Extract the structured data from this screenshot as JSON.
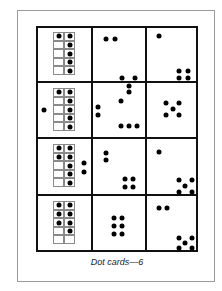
{
  "caption": "Dot cards—6",
  "grid": {
    "left": 36,
    "top": 26,
    "col_x": [
      36,
      92,
      146,
      197
    ],
    "row_y": [
      26,
      82,
      138,
      195,
      251
    ]
  },
  "rows": [
    {
      "tenframe": {
        "x": 53,
        "y": 32,
        "filled": [
          [
            0,
            0
          ],
          [
            0,
            1
          ],
          [
            1,
            1
          ],
          [
            2,
            1
          ],
          [
            3,
            1
          ],
          [
            4,
            1
          ]
        ]
      },
      "extra_dots": [],
      "col2_dots": [
        [
          14,
          13
        ],
        [
          23,
          13
        ],
        [
          30,
          52
        ],
        [
          43,
          52
        ],
        [
          37,
          60
        ]
      ],
      "col3_dots": [
        [
          13,
          10
        ],
        [
          33,
          45
        ],
        [
          42,
          45
        ],
        [
          33,
          52
        ],
        [
          42,
          52
        ]
      ]
    },
    {
      "tenframe": {
        "x": 53,
        "y": 88,
        "filled": [
          [
            0,
            0
          ],
          [
            0,
            1
          ],
          [
            1,
            1
          ],
          [
            2,
            1
          ],
          [
            3,
            1
          ],
          [
            4,
            1
          ]
        ]
      },
      "extra_dots": [
        [
          44,
          110
        ]
      ],
      "col2_dots": [
        [
          37,
          10
        ],
        [
          29,
          19
        ],
        [
          6,
          25
        ],
        [
          6,
          33
        ],
        [
          29,
          44
        ],
        [
          37,
          44
        ],
        [
          45,
          44
        ]
      ],
      "col3_dots": [
        [
          20,
          21
        ],
        [
          33,
          21
        ],
        [
          27,
          27
        ],
        [
          20,
          33
        ],
        [
          33,
          33
        ]
      ]
    },
    {
      "tenframe": {
        "x": 53,
        "y": 144,
        "filled": [
          [
            0,
            0
          ],
          [
            0,
            1
          ],
          [
            1,
            0
          ],
          [
            1,
            1
          ],
          [
            2,
            1
          ],
          [
            3,
            1
          ],
          [
            4,
            1
          ]
        ]
      },
      "extra_dots": [
        [
          84,
          163
        ],
        [
          84,
          172
        ]
      ],
      "col2_dots": [
        [
          14,
          15
        ],
        [
          14,
          22
        ],
        [
          33,
          41
        ],
        [
          41,
          41
        ],
        [
          33,
          49
        ],
        [
          41,
          49
        ]
      ],
      "col3_dots": [
        [
          13,
          14
        ],
        [
          33,
          42
        ],
        [
          46,
          42
        ],
        [
          39,
          48
        ],
        [
          33,
          54
        ],
        [
          46,
          54
        ]
      ]
    },
    {
      "tenframe": {
        "x": 53,
        "y": 201,
        "filled": [
          [
            0,
            0
          ],
          [
            0,
            1
          ],
          [
            1,
            0
          ],
          [
            1,
            1
          ],
          [
            2,
            0
          ],
          [
            2,
            1
          ],
          [
            3,
            1
          ]
        ]
      },
      "extra_dots": [],
      "col2_dots": [
        [
          22,
          23
        ],
        [
          30,
          23
        ],
        [
          22,
          31
        ],
        [
          30,
          31
        ],
        [
          22,
          39
        ],
        [
          30,
          39
        ]
      ],
      "col3_dots": [
        [
          13,
          13
        ],
        [
          21,
          13
        ],
        [
          33,
          43
        ],
        [
          46,
          43
        ],
        [
          39,
          48
        ],
        [
          33,
          53
        ],
        [
          46,
          53
        ]
      ]
    }
  ]
}
